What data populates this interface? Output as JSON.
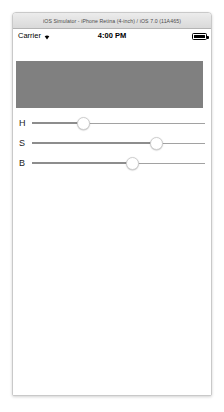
{
  "window": {
    "title": "iOS Simulator - iPhone Retina (4-inch) / iOS 7.0 (11A465)"
  },
  "status_bar": {
    "carrier": "Carrier",
    "wifi_icon": "wifi-icon",
    "time": "4:00 PM",
    "battery_icon": "battery-icon",
    "battery_level_percent": 100
  },
  "preview": {
    "swatch_color": "#808080",
    "name": "color-preview-swatch"
  },
  "sliders": [
    {
      "label": "H",
      "name": "hue-slider",
      "value_percent": 30,
      "track_color": "#a2a2a2",
      "thumb_color": "#ffffff"
    },
    {
      "label": "S",
      "name": "saturation-slider",
      "value_percent": 72,
      "track_color": "#a2a2a2",
      "thumb_color": "#ffffff"
    },
    {
      "label": "B",
      "name": "brightness-slider",
      "value_percent": 58,
      "track_color": "#a2a2a2",
      "thumb_color": "#ffffff"
    }
  ]
}
